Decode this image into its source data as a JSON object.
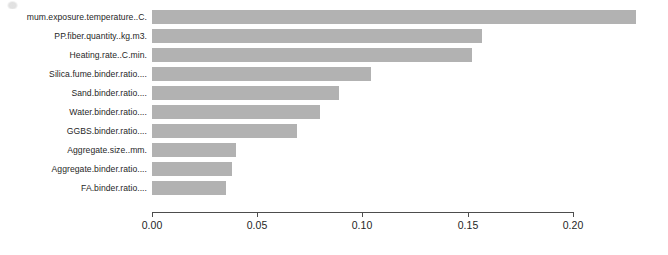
{
  "chart_data": {
    "type": "bar",
    "orientation": "horizontal",
    "title": "",
    "xlabel": "",
    "ylabel": "",
    "xlim": [
      0.0,
      0.2
    ],
    "grid": false,
    "legend": null,
    "bar_color": "#b2b2b2",
    "axis_color": "#4d4d4d",
    "tick_labels": [
      "0.00",
      "0.05",
      "0.10",
      "0.15",
      "0.20"
    ],
    "tick_values": [
      0.0,
      0.05,
      0.1,
      0.15,
      0.2
    ],
    "categories": [
      "mum.exposure.temperature..C.",
      "PP.fiber.quantity..kg.m3.",
      "Heating.rate..C.min.",
      "Silica.fume.binder.ratio....",
      "Sand.binder.ratio....",
      "Water.binder.ratio....",
      "GGBS.binder.ratio....",
      "Aggregate.size..mm.",
      "Aggregate.binder.ratio....",
      "FA.binder.ratio...."
    ],
    "values": [
      0.23,
      0.157,
      0.152,
      0.104,
      0.089,
      0.08,
      0.069,
      0.04,
      0.038,
      0.035
    ]
  }
}
